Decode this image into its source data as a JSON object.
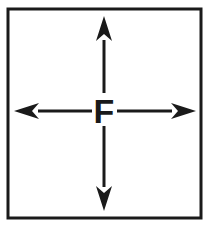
{
  "figure": {
    "kind": "force-diagram",
    "center_label": "F",
    "background_color": "#ffffff",
    "ink_color": "#1a1a1a",
    "frame": {
      "name": "border-box",
      "x": 8,
      "y": 9,
      "width": 193,
      "height": 209,
      "stroke_width": 3,
      "color": "#1a1a1a"
    },
    "center": {
      "x": 104,
      "y": 111
    },
    "arrows": [
      {
        "name": "arrow-up",
        "direction": "up",
        "label": "up",
        "shaft_from": {
          "x": 104,
          "y": 96
        },
        "shaft_to": {
          "x": 104,
          "y": 40
        },
        "tip": {
          "x": 104,
          "y": 16
        },
        "head_length": 25,
        "head_half_width": 8,
        "barb_inset": 7,
        "stroke_width": 3,
        "color": "#1a1a1a"
      },
      {
        "name": "arrow-down",
        "direction": "down",
        "label": "down",
        "shaft_from": {
          "x": 104,
          "y": 126
        },
        "shaft_to": {
          "x": 104,
          "y": 187
        },
        "tip": {
          "x": 104,
          "y": 211
        },
        "head_length": 25,
        "head_half_width": 8,
        "barb_inset": 7,
        "stroke_width": 3,
        "color": "#1a1a1a"
      },
      {
        "name": "arrow-left",
        "direction": "left",
        "label": "left",
        "shaft_from": {
          "x": 92,
          "y": 111
        },
        "shaft_to": {
          "x": 38,
          "y": 111
        },
        "tip": {
          "x": 14,
          "y": 111
        },
        "head_length": 25,
        "head_half_width": 8,
        "barb_inset": 7,
        "stroke_width": 3,
        "color": "#1a1a1a"
      },
      {
        "name": "arrow-right",
        "direction": "right",
        "label": "right",
        "shaft_from": {
          "x": 117,
          "y": 111
        },
        "shaft_to": {
          "x": 172,
          "y": 111
        },
        "tip": {
          "x": 196,
          "y": 111
        },
        "head_length": 25,
        "head_half_width": 8,
        "barb_inset": 7,
        "stroke_width": 3,
        "color": "#1a1a1a"
      }
    ],
    "label_geometry": {
      "x": 104,
      "y": 123,
      "font_size": 34,
      "backing_x": 93,
      "backing_y": 93,
      "backing_width": 23,
      "backing_height": 32
    }
  }
}
